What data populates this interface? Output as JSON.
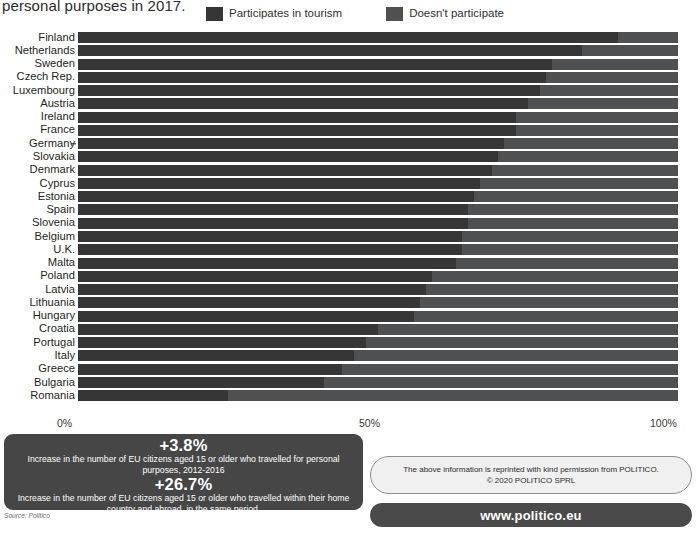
{
  "title": {
    "text": "personal purposes in 2017."
  },
  "legend": {
    "items": [
      {
        "label": "Participates in tourism",
        "color": "#363636",
        "icon": "legend-swatch-participates"
      },
      {
        "label": "Doesn't participate",
        "color": "#4f5052",
        "icon": "legend-swatch-doesnt-participate"
      }
    ]
  },
  "axis": {
    "ticks": [
      "0%",
      "50%",
      "100%"
    ]
  },
  "chart_data": {
    "type": "bar",
    "orientation": "horizontal",
    "stacked": true,
    "xlabel": "",
    "ylabel": "",
    "xlim": [
      0,
      100
    ],
    "tick_labels": [
      "0%",
      "50%",
      "100%"
    ],
    "grid": false,
    "legend_position": "top",
    "categories": [
      "Finland",
      "Netherlands",
      "Sweden",
      "Czech Rep.",
      "Luxembourg",
      "Austria",
      "Ireland",
      "France",
      "Germany",
      "Slovakia",
      "Denmark",
      "Cyprus",
      "Estonia",
      "Spain",
      "Slovenia",
      "Belgium",
      "U.K.",
      "Malta",
      "Poland",
      "Latvia",
      "Lithuania",
      "Hungary",
      "Croatia",
      "Portugal",
      "Italy",
      "Greece",
      "Bulgaria",
      "Romania"
    ],
    "series": [
      {
        "name": "Participates in tourism",
        "color": "#363636",
        "values": [
          90,
          84,
          79,
          78,
          77,
          75,
          73,
          73,
          71,
          70,
          69,
          67,
          66,
          65,
          65,
          64,
          64,
          63,
          59,
          58,
          57,
          56,
          50,
          48,
          46,
          44,
          41,
          25
        ]
      },
      {
        "name": "Doesn't participate",
        "color": "#4f5052",
        "values": [
          10,
          16,
          21,
          22,
          23,
          25,
          27,
          27,
          29,
          30,
          31,
          33,
          34,
          35,
          35,
          36,
          36,
          37,
          41,
          42,
          43,
          44,
          50,
          52,
          54,
          56,
          59,
          75
        ]
      }
    ]
  },
  "stats": {
    "items": [
      {
        "value": "+3.8%",
        "description": "Increase in the number of EU citizens aged 15 or older who travelled for personal  purposes, 2012-2016"
      },
      {
        "value": "+26.7%",
        "description": "Increase in the number of EU citizens aged 15 or older who travelled within their home country and abroad, in the same period."
      }
    ]
  },
  "source_note": "Source: Politico",
  "permission": {
    "line1": "The above information is reprinted with kind permission from POLITICO.",
    "line2": "© 2020 POLITICO SPRL"
  },
  "url": {
    "label": "www.politico.eu"
  }
}
